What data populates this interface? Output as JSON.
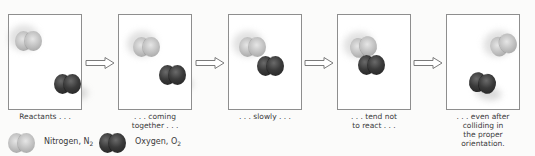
{
  "diagram": {
    "panels": [
      {
        "id": "reactants",
        "caption": "Reactants . . ."
      },
      {
        "id": "coming-together",
        "caption_line1": ". . . coming",
        "caption_line2": "together . . ."
      },
      {
        "id": "slowly",
        "caption": ". . . slowly . . ."
      },
      {
        "id": "tend-not",
        "caption_line1": ". . . tend not",
        "caption_line2": "to react . . ."
      },
      {
        "id": "even-after",
        "caption_line1": ". . . even after",
        "caption_line2": "colliding in",
        "caption_line3": "the proper",
        "caption_line4": "orientation."
      }
    ],
    "arrow_count": 4,
    "legend": {
      "nitrogen": {
        "label": "Nitrogen, N",
        "subscript": "2",
        "color": "#c0c0c0"
      },
      "oxygen": {
        "label": "Oxygen, O",
        "subscript": "2",
        "color": "#333333"
      }
    },
    "colors": {
      "panel_border": "#8e8e8e",
      "arrow_outline": "#7a7a7a",
      "background": "#fbfbfa"
    }
  }
}
